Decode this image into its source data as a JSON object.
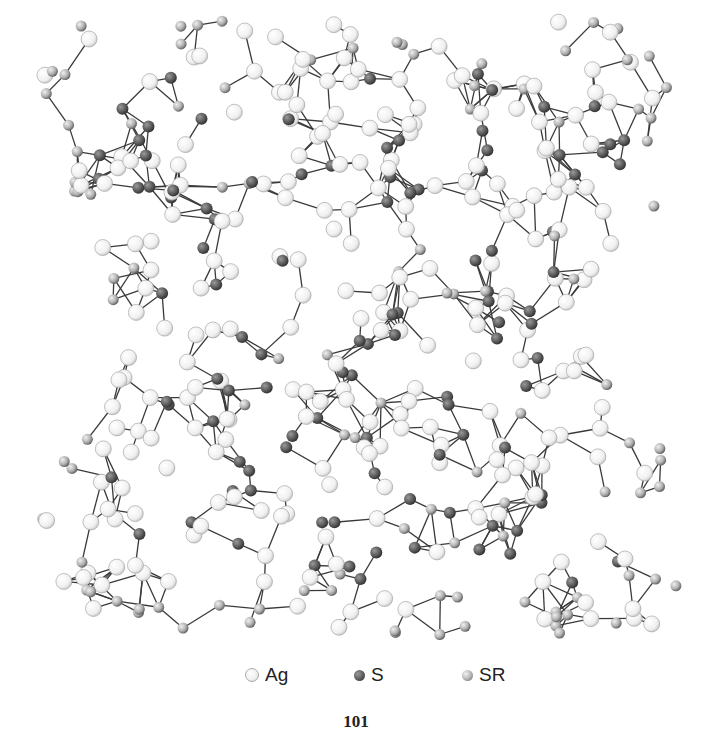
{
  "figure": {
    "colors": {
      "Ag": "#f4f4f4",
      "Ag_stroke": "#9a9a9a",
      "S": "#5e5e5e",
      "S_stroke": "#303030",
      "SR": "#b8b8b8",
      "SR_stroke": "#555555",
      "bond": "#3a3a3a"
    },
    "bounds": {
      "x0": 25,
      "y0": 20,
      "x1": 690,
      "y1": 635
    },
    "seed": 101
  },
  "legend": {
    "items": [
      {
        "symbol": "Ag",
        "label": "Ag"
      },
      {
        "symbol": "S",
        "label": "S"
      },
      {
        "symbol": "SR",
        "label": "SR"
      }
    ]
  },
  "page_number": "101"
}
